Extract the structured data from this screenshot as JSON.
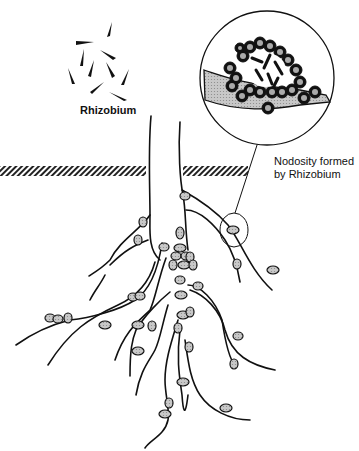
{
  "diagram": {
    "labels": {
      "bacteria": "Rhizobium",
      "nodosity_line1": "Nodosity formed",
      "nodosity_line2": "by Rhizobium"
    },
    "colors": {
      "stroke": "#111111",
      "nodule_fill": "#a8a8a8",
      "soil_hatch": "#222222",
      "background": "#ffffff"
    },
    "elements": [
      "rhizobium-bacteria-cluster",
      "root-system",
      "soil-line",
      "root-nodules",
      "magnified-nodule-inset",
      "callout-circle"
    ]
  }
}
